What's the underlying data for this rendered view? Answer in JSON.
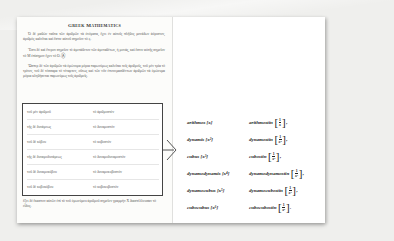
{
  "heading": "Greek Mathematics",
  "paragraphs": [
    "Ὁ δὲ μαθὼν ταῦτα τῶν ἀριθμῶν τὰ ὀνόματα, ἔχει ἐν αὐτοῖς πλῆθος μονάδων ἀόριστον, ἀριθμὸς καλεῖται καὶ ἔστιν αὐτοῦ σημεῖον τὸ ϛ.",
    "Ἔστι δὲ καὶ ἕτερον σημεῖον τὸ ἀμετάθετον τῶν ἀμεταθέτων, ἡ μονάς, καὶ ἔστιν αὐτῆς σημεῖον τὸ Μ ἐπίσημον ἔχον τὸ Ο.",
    "Ὥσπερ δὲ τῶν ἀριθμῶν τὰ ὁμώνυμα μόρια παρωνύμως καλεῖται τοῖς ἀριθμοῖς, τοῦ μὲν τρία τὸ τρίτον, τοῦ δὲ τέσσαρα τὸ τέταρτον, οὕτως καὶ τῶν νῦν ἐπονομασθέντων ἀριθμῶν τὰ ὁμώνυμα μόρια κληθήσεται παρωνύμως τοῖς ἀριθμοῖς."
  ],
  "lock_icon": "Ⓐ",
  "table_rows": [
    {
      "greek": "τοῦ μὲν ἀριθμοῦ",
      "part": "τὸ ἀριθμοστόν"
    },
    {
      "greek": "τῆς δὲ δυνάμεως",
      "part": "τὸ δυναμοστόν"
    },
    {
      "greek": "τοῦ δὲ κύβου",
      "part": "τὸ κυβοστόν"
    },
    {
      "greek": "τῆς δὲ δυναμοδυνάμεως",
      "part": "τὸ δυναμοδυναμοστόν"
    },
    {
      "greek": "τοῦ δὲ δυναμοκύβου",
      "part": "τὸ δυναμοκυβοστόν"
    },
    {
      "greek": "τοῦ δὲ κυβοκύβου",
      "part": "τὸ κυβοκυβοστόν"
    }
  ],
  "caption": "ἕξει δὲ ἕκαστον αὐτῶν ἐπὶ τὸ τοῦ ὁμωνύμου ἀριθμοῦ σημεῖον γραμμὴν Χ διαστέλλουσαν τὸ εἶδος.",
  "latin_terms": [
    {
      "term": "arithmos",
      "power": "[x]",
      "inverse": "arithmostin",
      "num": "1",
      "den": "x",
      "comma": ","
    },
    {
      "term": "dynamis",
      "power": "[x²]",
      "inverse": "dynamostin",
      "num": "1",
      "den": "x²",
      "comma": ","
    },
    {
      "term": "cubus",
      "power": "[x³]",
      "inverse": "cubostin",
      "num": "1",
      "den": "x³",
      "comma": ","
    },
    {
      "term": "dynamodynamis",
      "power": "[x⁴]",
      "inverse": "dynamodynamostin",
      "num": "1",
      "den": "x⁴",
      "comma": ","
    },
    {
      "term": "dynamocubus",
      "power": "[x⁵]",
      "inverse": "dynamocubostin",
      "num": "1",
      "den": "x⁵",
      "comma": ","
    },
    {
      "term": "cubocubus",
      "power": "[x⁶]",
      "inverse": "cubocubostin",
      "num": "1",
      "den": "x⁶",
      "comma": "."
    }
  ],
  "brackets": {
    "open": "[",
    "close": "]"
  }
}
